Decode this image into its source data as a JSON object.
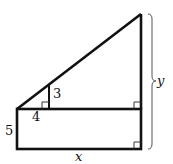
{
  "diagram": {
    "type": "geometry-figure",
    "labels": {
      "small_triangle_height": "3",
      "small_triangle_base": "4",
      "rectangle_height": "5",
      "total_width": "x",
      "total_height": "y"
    },
    "colors": {
      "stroke": "#111111",
      "brace": "#555555",
      "background": "#ffffff"
    }
  }
}
